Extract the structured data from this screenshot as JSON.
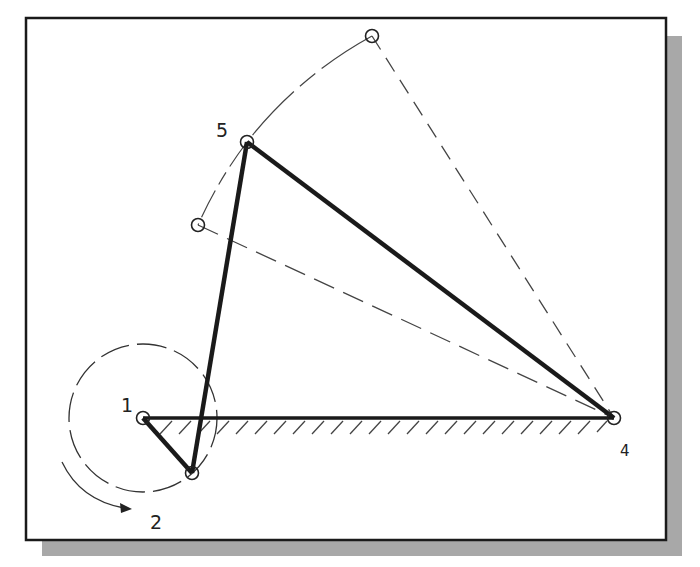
{
  "diagram": {
    "type": "four-bar-linkage-sketch",
    "frame": {
      "x": 26,
      "y": 18,
      "w": 640,
      "h": 522,
      "shadow_offset": 16,
      "shadow_color": "#a8a8a8",
      "border_color": "#1a1a1a"
    },
    "joints": [
      {
        "id": "1",
        "label": "1",
        "x": 143,
        "y": 418,
        "label_x": 121,
        "label_y": 412
      },
      {
        "id": "2",
        "label": "2",
        "x": 192,
        "y": 473,
        "label_x": 150,
        "label_y": 528
      },
      {
        "id": "4",
        "label": "4",
        "x": 614,
        "y": 418,
        "label_x": 620,
        "label_y": 454
      },
      {
        "id": "5",
        "label": "5",
        "x": 247,
        "y": 142,
        "label_x": 216,
        "label_y": 136
      },
      {
        "id": "top",
        "label": "",
        "x": 372,
        "y": 36
      },
      {
        "id": "low",
        "label": "",
        "x": 198,
        "y": 225
      }
    ],
    "links": [
      {
        "from": "1",
        "to": "2",
        "style": "bold"
      },
      {
        "from": "2",
        "to": "5",
        "style": "bold"
      },
      {
        "from": "5",
        "to": "4",
        "style": "bold"
      },
      {
        "from": "1",
        "to": "4",
        "style": "ground"
      }
    ],
    "construction_lines": [
      {
        "from": "top",
        "to": "4",
        "style": "dashed"
      },
      {
        "from": "low",
        "to": "4",
        "style": "dashed"
      }
    ],
    "labels": {
      "joint_1": "1",
      "joint_2": "2",
      "joint_4": "4",
      "joint_5": "5"
    },
    "colors": {
      "ink": "#1a1a1a",
      "construction": "#444444",
      "shadow": "#a8a8a8",
      "background": "#ffffff"
    }
  }
}
